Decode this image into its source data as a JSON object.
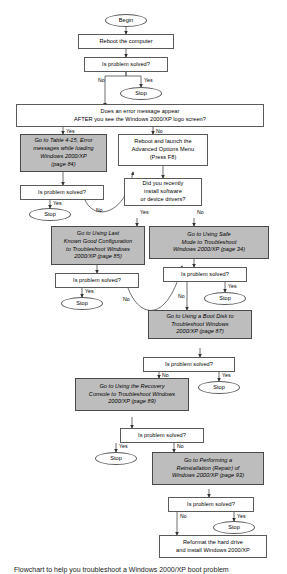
{
  "figure": {
    "type": "flowchart",
    "caption": "Flowchart to help you troubleshoot a Windows 2000/XP boot problem",
    "colors": {
      "action_fill": "#bdbdbd",
      "process_fill": "#ffffff",
      "border": "#5a5a5a",
      "text": "#000000",
      "page_background": "#ffffff"
    }
  },
  "nodes": {
    "begin": "Begin",
    "reboot_computer": "Reboot the computer",
    "solved_1": "Is problem solved?",
    "stop_1": "Stop",
    "error_message_question": "Does an error message appear\nAFTER you see the Windows 2000/XP logo screen?",
    "table_4_15": "Go to Table 4-15, Error\nmessages while loading\nWindows 2000/XP\n(page 84)",
    "advanced_options": "Reboot and launch the\nAdvanced Options Menu\n(Press F8)",
    "solved_2": "Is problem solved?",
    "stop_2": "Stop",
    "recent_install_question": "Did you recently\ninstall software\nor device drivers?",
    "last_known_good": "Go to Using Last\nKnown Good Configuration\nto Troubleshoot Windows\n2000/XP (page 85)",
    "safe_mode": "Go to Using Safe\nMode to Troubleshoot\nWindows 2000/XP (page 34)",
    "solved_3": "Is problem solved?",
    "stop_3": "Stop",
    "solved_4": "Is problem solved?",
    "stop_4": "Stop",
    "boot_disk": "Go to Using a Boot Disk to\nTroubleshoot Windows\n2000/XP (page 87)",
    "solved_5": "Is problem solved?",
    "stop_5": "Stop",
    "recovery_console": "Go to Using the Recovery\nConsole to Troubleshoot Windows\n2000/XP (page 89)",
    "solved_6": "Is problem solved?",
    "stop_6": "Stop",
    "reinstallation": "Go to Performing a\nReinstallation (Repair) of\nWindows 2000/XP (page 93)",
    "solved_7": "Is problem solved?",
    "stop_7": "Stop",
    "reformat": "Reformat the hard drive\nand install Windows 2000/XP"
  },
  "edge_labels": {
    "no_1": "No",
    "yes_1": "Yes",
    "yes_error": "Yes",
    "no_error": "No",
    "yes_2": "Yes",
    "no_2": "No",
    "yes_recent": "Yes",
    "no_recent": "No",
    "yes_3": "Yes",
    "no_3": "No",
    "yes_4": "Yes",
    "no_4": "No",
    "no_5": "No",
    "yes_5": "Yes",
    "yes_6": "Yes",
    "no_6": "No",
    "no_7": "No",
    "yes_7": "Yes"
  }
}
